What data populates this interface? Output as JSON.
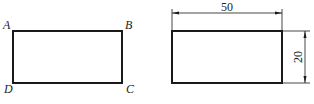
{
  "figure_left": {
    "shape": "rectangle",
    "vertices": {
      "top_left": "A",
      "top_right": "B",
      "bottom_right": "C",
      "bottom_left": "D"
    }
  },
  "figure_right": {
    "shape": "rectangle",
    "dimensions": {
      "width_label": "50",
      "height_label": "20"
    }
  },
  "colors": {
    "line": "#1a1a1a",
    "background": "#ffffff"
  }
}
